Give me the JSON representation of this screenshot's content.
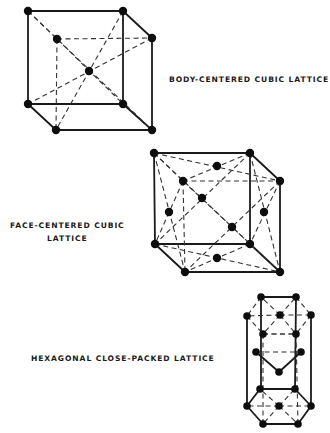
{
  "figure": {
    "labels": {
      "bcc": "BODY-CENTERED CUBIC LATTICE",
      "fcc_line1": "FACE-CENTERED CUBIC",
      "fcc_line2": "LATTICE",
      "hcp": "HEXAGONAL CLOSE-PACKED LATTICE"
    },
    "colors": {
      "ink": "#1a1a1a",
      "background": "#ffffff"
    },
    "lattices": [
      {
        "id": "bcc",
        "name": "Body-centered cubic",
        "corner_atoms": 8,
        "center_atoms": 1
      },
      {
        "id": "fcc",
        "name": "Face-centered cubic",
        "corner_atoms": 8,
        "face_atoms": 6
      },
      {
        "id": "hcp",
        "name": "Hexagonal close-packed",
        "layer_atoms": 14,
        "mid_layer_atoms": 3
      }
    ]
  }
}
